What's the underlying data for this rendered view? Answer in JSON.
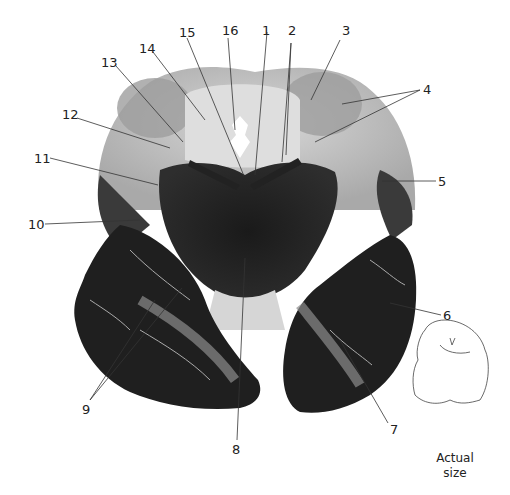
{
  "figure": {
    "labels": [
      {
        "id": "1",
        "x": 262,
        "y": 24
      },
      {
        "id": "2",
        "x": 288,
        "y": 24
      },
      {
        "id": "3",
        "x": 342,
        "y": 24
      },
      {
        "id": "4",
        "x": 423,
        "y": 83
      },
      {
        "id": "5",
        "x": 438,
        "y": 175
      },
      {
        "id": "6",
        "x": 443,
        "y": 309
      },
      {
        "id": "7",
        "x": 390,
        "y": 423
      },
      {
        "id": "8",
        "x": 232,
        "y": 443
      },
      {
        "id": "9",
        "x": 82,
        "y": 403
      },
      {
        "id": "10",
        "x": 28,
        "y": 218
      },
      {
        "id": "11",
        "x": 34,
        "y": 152
      },
      {
        "id": "12",
        "x": 62,
        "y": 108
      },
      {
        "id": "13",
        "x": 101,
        "y": 56
      },
      {
        "id": "14",
        "x": 139,
        "y": 42
      },
      {
        "id": "15",
        "x": 179,
        "y": 26
      },
      {
        "id": "16",
        "x": 222,
        "y": 24
      }
    ],
    "inset": {
      "caption_line1": "Actual",
      "caption_line2": "size"
    },
    "colors": {
      "background": "#ffffff",
      "pale_tissue": "#c9c9c9",
      "mid_tissue": "#8a8a8a",
      "dark_tissue": "#1c1c1c",
      "label_text": "#222222",
      "leader_line": "#333333"
    }
  }
}
